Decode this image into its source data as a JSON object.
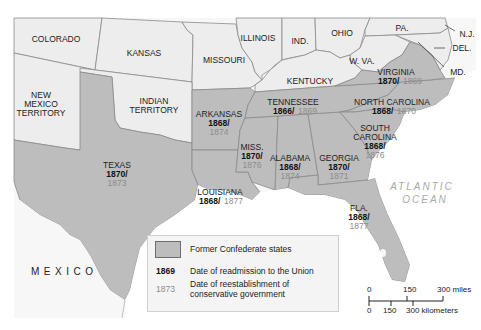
{
  "map": {
    "title": "Reconstruction in the South",
    "colors": {
      "confederate_fill": "#bdbdbd",
      "union_fill": "#ededed",
      "border": "#8a8a8a",
      "readmission_text": "#111111",
      "conservative_text": "#8c8c8c",
      "ocean_text": "#a9a9a9"
    },
    "non_confederate_regions": [
      {
        "name": "COLORADO"
      },
      {
        "name": "KANSAS"
      },
      {
        "name": "MISSOURI"
      },
      {
        "name": "ILLINOIS"
      },
      {
        "name": "IND."
      },
      {
        "name": "OHIO"
      },
      {
        "name": "PA."
      },
      {
        "name": "N.J."
      },
      {
        "name": "DEL."
      },
      {
        "name": "MD."
      },
      {
        "name": "W. VA."
      },
      {
        "name": "KENTUCKY"
      },
      {
        "name_lines": [
          "NEW",
          "MEXICO",
          "TERRITORY"
        ]
      },
      {
        "name_lines": [
          "INDIAN",
          "TERRITORY"
        ]
      }
    ],
    "confederate_states": [
      {
        "name": "TEXAS",
        "readmission": "1870/",
        "conservative": "1873"
      },
      {
        "name": "ARKANSAS",
        "readmission": "1868/",
        "conservative": "1874"
      },
      {
        "name": "LOUISIANA",
        "readmission": "1868/",
        "conservative": "1877"
      },
      {
        "name": "MISS.",
        "readmission": "1870/",
        "conservative": "1876"
      },
      {
        "name": "ALABAMA",
        "readmission": "1868/",
        "conservative": "1874"
      },
      {
        "name": "GEORGIA",
        "readmission": "1870/",
        "conservative": "1871"
      },
      {
        "name": "FLA.",
        "readmission": "1868/",
        "conservative": "1877"
      },
      {
        "name": "TENNESSEE",
        "readmission": "1866/",
        "conservative": "1869"
      },
      {
        "name": "NORTH CAROLINA",
        "readmission": "1868/",
        "conservative": "1870"
      },
      {
        "name_lines": [
          "SOUTH",
          "CAROLINA"
        ],
        "readmission": "1868/",
        "conservative": "1876"
      },
      {
        "name": "VIRGINIA",
        "readmission": "1870/",
        "conservative": "1869"
      }
    ],
    "water_labels": {
      "ocean_line1": "ATLANTIC",
      "ocean_line2": "OCEAN",
      "country": "MEXICO"
    }
  },
  "legend": {
    "confederate_label": "Former Confederate states",
    "readmission_sample": "1869",
    "readmission_label": "Date of readmission to the Union",
    "conservative_sample": "1873",
    "conservative_label_line1": "Date of reestablishment of",
    "conservative_label_line2": "conservative government"
  },
  "scale_bar": {
    "miles_ticks": [
      "0",
      "150",
      "300 miles"
    ],
    "km_ticks": [
      "0",
      "150",
      "300 kilometers"
    ]
  }
}
